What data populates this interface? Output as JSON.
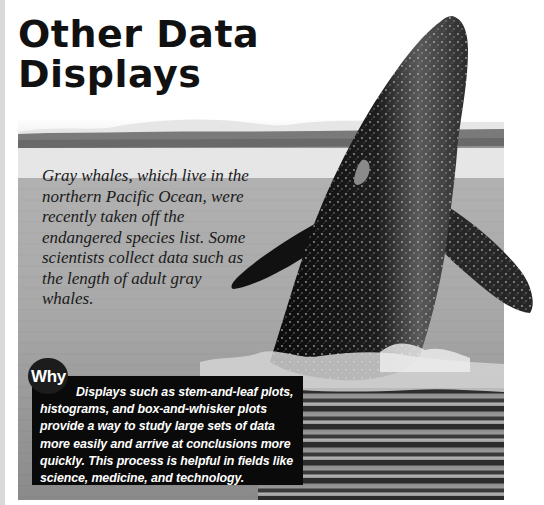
{
  "page": {
    "title_line1": "Other Data",
    "title_line2": "Displays"
  },
  "photo": {
    "subject": "gray whale breaching",
    "caption": "Gray whales, which live in the northern Pacific Ocean, were recently taken off the endangered species list. Some scientists collect data such as the length of adult gray whales."
  },
  "why_box": {
    "badge_label": "Why",
    "text": "Displays such as stem-and-leaf plots, histograms, and box-and-whisker plots provide a way to study large sets of data more easily and arrive at conclusions more quickly. This process is helpful in fields like science, medicine, and technology."
  },
  "colors": {
    "title": "#111111",
    "why_box_bg": "#0a0a0a",
    "why_text": "#ffffff",
    "water": "#a9a9a9",
    "left_rule": "#d9d9d9"
  }
}
